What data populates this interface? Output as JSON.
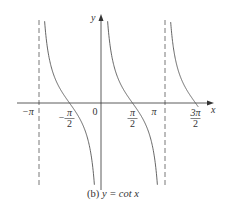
{
  "chart_data": {
    "type": "line",
    "title": "(b) y = cot x",
    "caption_prefix": "(b)",
    "caption_eq": "y = cot x",
    "function": "cot(x)",
    "xlabel": "x",
    "ylabel": "y",
    "xlim": [
      -3.4,
      4.85
    ],
    "ylim": [
      -3.0,
      3.0
    ],
    "grid": false,
    "legend": null,
    "x_ticks": [
      {
        "value": -3.14159,
        "label": "−π"
      },
      {
        "value": -1.5708,
        "label": "−π/2",
        "num": "π",
        "den": "2",
        "neg": true
      },
      {
        "value": 0,
        "label": "0"
      },
      {
        "value": 1.5708,
        "label": "π/2",
        "num": "π",
        "den": "2",
        "neg": false
      },
      {
        "value": 3.14159,
        "label": "π"
      },
      {
        "value": 4.7124,
        "label": "3π/2",
        "num": "3π",
        "den": "2",
        "neg": false
      }
    ],
    "asymptotes": [
      {
        "x": -3.14159,
        "label": "x = −π",
        "style": "dashed"
      },
      {
        "x": 0,
        "label": "x = 0",
        "style": "coincides with y-axis"
      },
      {
        "x": 3.14159,
        "label": "x = π",
        "style": "dashed"
      }
    ],
    "zeros": [
      -1.5708,
      1.5708,
      4.7124
    ],
    "branches": [
      {
        "domain": [
          -3.14159,
          0
        ]
      },
      {
        "domain": [
          0,
          3.14159
        ]
      },
      {
        "domain": [
          3.14159,
          4.85
        ]
      }
    ],
    "colors": {
      "curve": "#555555",
      "axis": "#333333",
      "asymptote": "#555555"
    }
  }
}
